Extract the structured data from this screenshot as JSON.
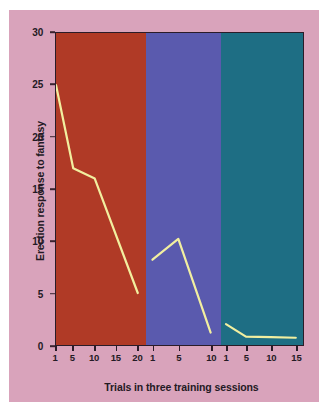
{
  "figure": {
    "background_color": "#ffffff",
    "card_color": "#d9a3bb"
  },
  "chart_data": {
    "type": "line",
    "title": "",
    "subtitle": "",
    "xlabel": "Trials in three training sessions",
    "ylabel": "Erection response to fantasy",
    "ylim": [
      0,
      30
    ],
    "yticks": [
      0,
      5,
      10,
      15,
      20,
      25,
      30
    ],
    "ytick_labels": [
      "0",
      "5",
      "10",
      "15",
      "20",
      "25",
      "30"
    ],
    "grid": false,
    "legend": "none",
    "line_color": "#f2efa0",
    "axis_color": "#2a1c28",
    "panels": [
      {
        "name": "session-1",
        "background_color": "#b03a26",
        "xticks": [
          1,
          5,
          10,
          15,
          20
        ],
        "xtick_labels": [
          "1",
          "5",
          "10",
          "15",
          "20"
        ],
        "xlim": [
          1,
          22
        ],
        "x": [
          1,
          5,
          10,
          20
        ],
        "y": [
          25,
          17,
          16,
          5
        ]
      },
      {
        "name": "session-2",
        "background_color": "#5a5aae",
        "xticks": [
          1,
          5,
          10
        ],
        "xtick_labels": [
          "1",
          "5",
          "10"
        ],
        "xlim": [
          0,
          11.5
        ],
        "x": [
          1,
          5,
          10
        ],
        "y": [
          8.2,
          10.2,
          1.2
        ]
      },
      {
        "name": "session-3",
        "background_color": "#1e6e84",
        "xticks": [
          1,
          5,
          10,
          15
        ],
        "xtick_labels": [
          "1",
          "5",
          "10",
          "15"
        ],
        "xlim": [
          0,
          16.5
        ],
        "x": [
          1,
          5,
          10,
          15
        ],
        "y": [
          2.0,
          0.8,
          0.75,
          0.7
        ]
      }
    ]
  }
}
